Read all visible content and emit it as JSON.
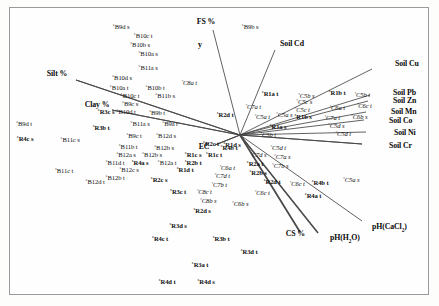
{
  "figure": {
    "type": "ordination-biplot",
    "axis_label_y": "y",
    "origin": {
      "x": 240,
      "y": 135
    }
  },
  "chart_data": {
    "type": "scatter",
    "title": "",
    "xlabel": "",
    "ylabel": "y",
    "grid": false,
    "legend": "none",
    "xlim": [
      0,
      439
    ],
    "ylim": [
      0,
      306
    ],
    "origin": {
      "x": 240,
      "y": 135
    },
    "environmental_vectors": [
      {
        "label": "FS %",
        "x": 206,
        "y": 22,
        "tip_x": 213,
        "tip_y": 30,
        "anchor": "center"
      },
      {
        "label": "Soil Cd",
        "x": 292,
        "y": 44,
        "tip_x": 275,
        "tip_y": 50,
        "anchor": "center"
      },
      {
        "label": "Soil Cu",
        "x": 395,
        "y": 64,
        "tip_x": 372,
        "tip_y": 69,
        "anchor": "left"
      },
      {
        "label": "Soil Pb",
        "x": 393,
        "y": 93,
        "tip_x": 370,
        "tip_y": 95,
        "anchor": "left"
      },
      {
        "label": "Soil Zn",
        "x": 393,
        "y": 101,
        "tip_x": 368,
        "tip_y": 101,
        "anchor": "left"
      },
      {
        "label": "Soil Mn",
        "x": 391,
        "y": 112,
        "tip_x": 366,
        "tip_y": 112,
        "anchor": "left"
      },
      {
        "label": "Soil Co",
        "x": 389,
        "y": 121,
        "tip_x": 364,
        "tip_y": 120,
        "anchor": "left"
      },
      {
        "label": "Soil Ni",
        "x": 394,
        "y": 133,
        "tip_x": 366,
        "tip_y": 132,
        "anchor": "left"
      },
      {
        "label": "Soil Cr",
        "x": 389,
        "y": 146,
        "tip_x": 362,
        "tip_y": 144,
        "anchor": "left"
      },
      {
        "label": "pH(CaCl2)",
        "x": 372,
        "y": 228,
        "tip_x": 362,
        "tip_y": 221,
        "anchor": "left"
      },
      {
        "label": "pH(H2O)",
        "x": 330,
        "y": 239,
        "tip_x": 318,
        "tip_y": 233,
        "anchor": "left"
      },
      {
        "label": "CS %",
        "x": 305,
        "y": 234,
        "tip_x": 300,
        "tip_y": 232,
        "anchor": "right"
      },
      {
        "label": "Silt %",
        "x": 57,
        "y": 74,
        "tip_x": 76,
        "tip_y": 80,
        "anchor": "center"
      },
      {
        "label": "Clay %",
        "x": 97,
        "y": 105,
        "tip_x": 112,
        "tip_y": 110,
        "anchor": "center"
      },
      {
        "label": "EC",
        "x": 204,
        "y": 147,
        "tip_x": 215,
        "tip_y": 145,
        "anchor": "center"
      }
    ],
    "sample_points": [
      {
        "label": "B9d s",
        "x": 121,
        "y": 27,
        "style": "light"
      },
      {
        "label": "B10c t",
        "x": 143,
        "y": 36,
        "style": "light"
      },
      {
        "label": "B10b s",
        "x": 140,
        "y": 45,
        "style": "light"
      },
      {
        "label": "B10a s",
        "x": 148,
        "y": 54,
        "style": "light"
      },
      {
        "label": "B11a s",
        "x": 148,
        "y": 68,
        "style": "light"
      },
      {
        "label": "B9b s",
        "x": 250,
        "y": 27,
        "style": "light"
      },
      {
        "label": "B10d s",
        "x": 122,
        "y": 78,
        "style": "light"
      },
      {
        "label": "C8a t",
        "x": 189,
        "y": 83,
        "style": "ital"
      },
      {
        "label": "B10a t",
        "x": 119,
        "y": 88,
        "style": "light"
      },
      {
        "label": "B10b t",
        "x": 155,
        "y": 88,
        "style": "light"
      },
      {
        "label": "B10c t",
        "x": 130,
        "y": 96,
        "style": "light"
      },
      {
        "label": "B11b s",
        "x": 165,
        "y": 96,
        "style": "light"
      },
      {
        "label": "B9c s",
        "x": 130,
        "y": 104,
        "style": "light"
      },
      {
        "label": "B10d t",
        "x": 126,
        "y": 112,
        "style": "light"
      },
      {
        "label": "B9b t",
        "x": 157,
        "y": 113,
        "style": "light"
      },
      {
        "label": "B9d t",
        "x": 24,
        "y": 124,
        "style": "light"
      },
      {
        "label": "R3c s",
        "x": 106,
        "y": 112,
        "style": "bold"
      },
      {
        "label": "R3b t",
        "x": 101,
        "y": 128,
        "style": "bold"
      },
      {
        "label": "B11a s",
        "x": 140,
        "y": 124,
        "style": "light"
      },
      {
        "label": "B9a t",
        "x": 170,
        "y": 124,
        "style": "light"
      },
      {
        "label": "B9c t",
        "x": 134,
        "y": 136,
        "style": "light"
      },
      {
        "label": "B12d s",
        "x": 166,
        "y": 136,
        "style": "light"
      },
      {
        "label": "R4c s",
        "x": 25,
        "y": 139,
        "style": "bold"
      },
      {
        "label": "B11c s",
        "x": 70,
        "y": 140,
        "style": "light"
      },
      {
        "label": "B11b t",
        "x": 128,
        "y": 147,
        "style": "light"
      },
      {
        "label": "B12b s",
        "x": 164,
        "y": 148,
        "style": "light"
      },
      {
        "label": "R2c t",
        "x": 211,
        "y": 144,
        "style": "bold"
      },
      {
        "label": "R4b t",
        "x": 229,
        "y": 148,
        "style": "bold"
      },
      {
        "label": "B12a s",
        "x": 126,
        "y": 155,
        "style": "light"
      },
      {
        "label": "B12b s",
        "x": 152,
        "y": 155,
        "style": "light"
      },
      {
        "label": "R1c s",
        "x": 193,
        "y": 155,
        "style": "bold"
      },
      {
        "label": "R1c t",
        "x": 214,
        "y": 155,
        "style": "bold"
      },
      {
        "label": "B11d t",
        "x": 115,
        "y": 163,
        "style": "light"
      },
      {
        "label": "R4a s",
        "x": 140,
        "y": 163,
        "style": "bold"
      },
      {
        "label": "B12a t",
        "x": 167,
        "y": 163,
        "style": "light"
      },
      {
        "label": "R2b t",
        "x": 193,
        "y": 163,
        "style": "bold"
      },
      {
        "label": "B11c t",
        "x": 64,
        "y": 171,
        "style": "light"
      },
      {
        "label": "B12c s",
        "x": 129,
        "y": 170,
        "style": "light"
      },
      {
        "label": "R1d t",
        "x": 185,
        "y": 170,
        "style": "bold"
      },
      {
        "label": "C6a t",
        "x": 227,
        "y": 168,
        "style": "ital"
      },
      {
        "label": "C7d t",
        "x": 222,
        "y": 176,
        "style": "ital"
      },
      {
        "label": "B12b t",
        "x": 115,
        "y": 178,
        "style": "light"
      },
      {
        "label": "B12d t",
        "x": 95,
        "y": 182,
        "style": "light"
      },
      {
        "label": "R2c s",
        "x": 159,
        "y": 180,
        "style": "bold"
      },
      {
        "label": "C7b t",
        "x": 219,
        "y": 185,
        "style": "ital"
      },
      {
        "label": "R3c t",
        "x": 178,
        "y": 192,
        "style": "bold"
      },
      {
        "label": "C8c t",
        "x": 204,
        "y": 192,
        "style": "ital"
      },
      {
        "label": "C8b s",
        "x": 208,
        "y": 201,
        "style": "ital"
      },
      {
        "label": "C6b s",
        "x": 240,
        "y": 204,
        "style": "ital"
      },
      {
        "label": "R2d s",
        "x": 202,
        "y": 211,
        "style": "bold"
      },
      {
        "label": "R3d s",
        "x": 178,
        "y": 226,
        "style": "bold"
      },
      {
        "label": "R4c t",
        "x": 160,
        "y": 239,
        "style": "bold"
      },
      {
        "label": "R3b t",
        "x": 221,
        "y": 239,
        "style": "bold"
      },
      {
        "label": "R3d t",
        "x": 249,
        "y": 252,
        "style": "bold"
      },
      {
        "label": "R3a t",
        "x": 200,
        "y": 265,
        "style": "bold"
      },
      {
        "label": "R4d t",
        "x": 167,
        "y": 282,
        "style": "bold"
      },
      {
        "label": "R4d s",
        "x": 206,
        "y": 282,
        "style": "bold"
      },
      {
        "label": "R1a t",
        "x": 270,
        "y": 94,
        "style": "bold"
      },
      {
        "label": "C5b s",
        "x": 306,
        "y": 96,
        "style": "ital"
      },
      {
        "label": "R1b t",
        "x": 337,
        "y": 93,
        "style": "bold"
      },
      {
        "label": "C5b t",
        "x": 362,
        "y": 95,
        "style": "ital"
      },
      {
        "label": "C7a t",
        "x": 253,
        "y": 107,
        "style": "ital"
      },
      {
        "label": "C5c s",
        "x": 304,
        "y": 102,
        "style": "ital"
      },
      {
        "label": "C5c t",
        "x": 302,
        "y": 110,
        "style": "ital"
      },
      {
        "label": "C6a t",
        "x": 337,
        "y": 108,
        "style": "ital"
      },
      {
        "label": "C6c t",
        "x": 364,
        "y": 106,
        "style": "ital"
      },
      {
        "label": "R2d t",
        "x": 225,
        "y": 115,
        "style": "bold"
      },
      {
        "label": "C5a t",
        "x": 262,
        "y": 117,
        "style": "ital"
      },
      {
        "label": "C5a s",
        "x": 284,
        "y": 115,
        "style": "ital"
      },
      {
        "label": "R1b s",
        "x": 303,
        "y": 117,
        "style": "bold"
      },
      {
        "label": "C7a t",
        "x": 332,
        "y": 118,
        "style": "ital"
      },
      {
        "label": "C6b s",
        "x": 359,
        "y": 117,
        "style": "ital"
      },
      {
        "label": "R1a s",
        "x": 278,
        "y": 127,
        "style": "bold"
      },
      {
        "label": "C5d s",
        "x": 336,
        "y": 126,
        "style": "ital"
      },
      {
        "label": "C5b t",
        "x": 268,
        "y": 135,
        "style": "ital"
      },
      {
        "label": "C5d t",
        "x": 343,
        "y": 134,
        "style": "ital"
      },
      {
        "label": "R1d s",
        "x": 232,
        "y": 145,
        "style": "bold"
      },
      {
        "label": "C5d t",
        "x": 278,
        "y": 148,
        "style": "ital"
      },
      {
        "label": "C7d s",
        "x": 258,
        "y": 155,
        "style": "ital"
      },
      {
        "label": "C7a s",
        "x": 282,
        "y": 157,
        "style": "ital"
      },
      {
        "label": "R2a t",
        "x": 255,
        "y": 164,
        "style": "bold"
      },
      {
        "label": "C7b s",
        "x": 280,
        "y": 166,
        "style": "ital"
      },
      {
        "label": "R2b s",
        "x": 258,
        "y": 173,
        "style": "bold"
      },
      {
        "label": "R2d t",
        "x": 272,
        "y": 182,
        "style": "bold"
      },
      {
        "label": "C6c t",
        "x": 297,
        "y": 184,
        "style": "ital"
      },
      {
        "label": "R4b t",
        "x": 320,
        "y": 183,
        "style": "bold"
      },
      {
        "label": "C5a s",
        "x": 351,
        "y": 180,
        "style": "ital"
      },
      {
        "label": "C6c t",
        "x": 262,
        "y": 193,
        "style": "ital"
      },
      {
        "label": "R4a t",
        "x": 313,
        "y": 196,
        "style": "bold"
      }
    ]
  }
}
